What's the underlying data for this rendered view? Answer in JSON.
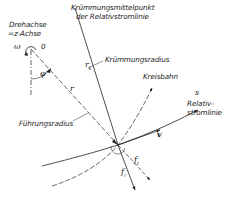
{
  "figure": {
    "labels": {
      "axis_line1": "Drehachse",
      "axis_line2": "=z-Achse",
      "center_point": "0",
      "omega": "ω",
      "phi": "φ",
      "r": "r",
      "curvature_center_line1": "Krümmungsmittelpunkt",
      "curvature_center_line2": "der Relativstromlinie",
      "curvature_radius": "Krümmungsradius",
      "circular_path": "Kreisbahn",
      "s": "s",
      "relative_streamline_line1": "Relativ-",
      "relative_streamline_line2": "stromlinie",
      "guide_radius": "Führungsradius",
      "v": "v",
      "rk_main": "r",
      "rk_sub": "k",
      "ft_main": "f",
      "ft_sub": "t",
      "fr_main": "f",
      "fr_sub": "r"
    },
    "colors": {
      "line": "#222222",
      "text": "#222222",
      "background": "#ffffff"
    }
  }
}
